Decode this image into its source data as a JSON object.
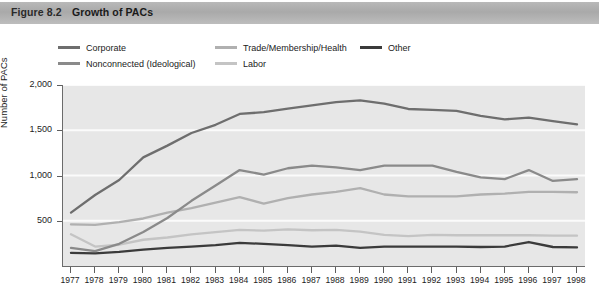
{
  "figure": {
    "number": "Figure 8.2",
    "title": "Growth of PACs"
  },
  "colors": {
    "plot_background": "#e7e7e7",
    "gridline": "#fbfbfb",
    "axis": "#6b6b6b",
    "corporate": "#6e6e6e",
    "nonconnected": "#8a8a8a",
    "trade": "#b0b0b0",
    "labor": "#c4c4c4",
    "other": "#3b3b3b",
    "title_bar": "#b0b0b0"
  },
  "legend": {
    "position": "top",
    "entries": [
      {
        "label": "Corporate",
        "color": "#6e6e6e",
        "x": 58,
        "y": 0
      },
      {
        "label": "Nonconnected (Ideological)",
        "color": "#8a8a8a",
        "x": 58,
        "y": 16
      },
      {
        "label": "Trade/Membership/Health",
        "color": "#b0b0b0",
        "x": 215,
        "y": 0
      },
      {
        "label": "Labor",
        "color": "#c4c4c4",
        "x": 215,
        "y": 16
      },
      {
        "label": "Other",
        "color": "#3b3b3b",
        "x": 360,
        "y": 0
      }
    ]
  },
  "chart_data": {
    "type": "line",
    "title": "Growth of PACs",
    "xlabel": "",
    "ylabel": "Number of PACs",
    "xlim": [
      1977,
      1998
    ],
    "ylim": [
      0,
      2000
    ],
    "yticks": [
      500,
      1000,
      1500,
      2000
    ],
    "ytick_labels": [
      "500",
      "1,000",
      "1,500",
      "2,000"
    ],
    "grid": true,
    "x": [
      1977,
      1978,
      1979,
      1980,
      1981,
      1982,
      1983,
      1984,
      1985,
      1986,
      1987,
      1988,
      1989,
      1990,
      1991,
      1992,
      1993,
      1994,
      1995,
      1996,
      1997,
      1998
    ],
    "xtick_labels": [
      "1977",
      "1978",
      "1979",
      "1980",
      "1981",
      "1982",
      "1983",
      "1984",
      "1985",
      "1986",
      "1987",
      "1988",
      "1989",
      "1990",
      "1991",
      "1992",
      "1993",
      "1994",
      "1995",
      "1996",
      "1997",
      "1998"
    ],
    "series": [
      {
        "name": "Corporate",
        "color": "#6e6e6e",
        "values": [
          590,
          785,
          950,
          1200,
          1330,
          1470,
          1560,
          1680,
          1700,
          1740,
          1775,
          1810,
          1830,
          1795,
          1735,
          1725,
          1715,
          1660,
          1620,
          1640,
          1600,
          1565
        ]
      },
      {
        "name": "Nonconnected (Ideological)",
        "color": "#8a8a8a",
        "values": [
          200,
          165,
          245,
          375,
          530,
          720,
          890,
          1060,
          1010,
          1080,
          1110,
          1090,
          1060,
          1110,
          1110,
          1110,
          1040,
          980,
          960,
          1060,
          940,
          960
        ]
      },
      {
        "name": "Trade/Membership/Health",
        "color": "#b0b0b0",
        "values": [
          460,
          455,
          485,
          525,
          590,
          640,
          700,
          760,
          690,
          750,
          790,
          820,
          860,
          790,
          770,
          770,
          770,
          790,
          800,
          820,
          820,
          815
        ]
      },
      {
        "name": "Labor",
        "color": "#c4c4c4",
        "values": [
          350,
          215,
          235,
          290,
          315,
          350,
          375,
          400,
          390,
          405,
          395,
          400,
          380,
          345,
          330,
          345,
          340,
          340,
          340,
          340,
          335,
          335
        ]
      },
      {
        "name": "Other",
        "color": "#3b3b3b",
        "values": [
          145,
          140,
          155,
          180,
          200,
          215,
          230,
          255,
          245,
          230,
          215,
          225,
          200,
          215,
          215,
          215,
          215,
          210,
          215,
          265,
          210,
          205
        ]
      }
    ]
  }
}
